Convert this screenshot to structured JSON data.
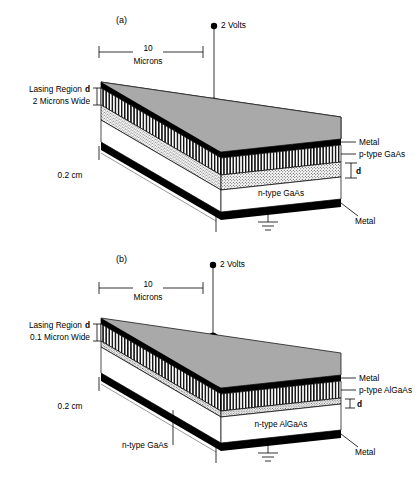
{
  "figure": {
    "type": "semiconductor-laser-diode-cross-section-diagram",
    "background_color": "#ffffff"
  },
  "colors": {
    "top_surface_gray": "#a9a9a9",
    "metal_black": "#000000",
    "substrate_white": "#ffffff",
    "line_black": "#000000",
    "leader_gray": "#555555"
  },
  "panels": [
    {
      "tag": "(a)",
      "voltage_label": "2 Volts",
      "width_dimension": {
        "value": "10",
        "units": "Microns"
      },
      "length_dimension": "0.2 cm",
      "lasing_region": {
        "line1": "Lasing Region",
        "symbol": "d",
        "line2": "2 Microns Wide"
      },
      "right_labels": [
        "Metal",
        "p-type GaAs"
      ],
      "thickness_symbol": "d",
      "body_label": "n-type GaAs",
      "bottom_label": "Metal",
      "ground": true
    },
    {
      "tag": "(b)",
      "voltage_label": "2 Volts",
      "width_dimension": {
        "value": "10",
        "units": "Microns"
      },
      "length_dimension": "0.2 cm",
      "lasing_region": {
        "line1": "Lasing Region",
        "symbol": "d",
        "line2": "0.1 Micron Wide"
      },
      "right_labels": [
        "Metal",
        "p-type AlGaAs"
      ],
      "thickness_symbol": "d",
      "body_label": "n-type AlGaAs",
      "substrate_label": "n-type GaAs",
      "bottom_label": "Metal",
      "ground": true
    }
  ]
}
